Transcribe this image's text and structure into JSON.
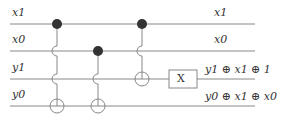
{
  "wires": [
    {
      "in": "x1",
      "out": "x1"
    },
    {
      "in": "x0",
      "out": "x0"
    },
    {
      "in": "y1",
      "out": "y1 ⊕ x1 ⊕ 1"
    },
    {
      "in": "y0",
      "out": "y0 ⊕ x1 ⊕ x0"
    }
  ],
  "gate_label": "X"
}
